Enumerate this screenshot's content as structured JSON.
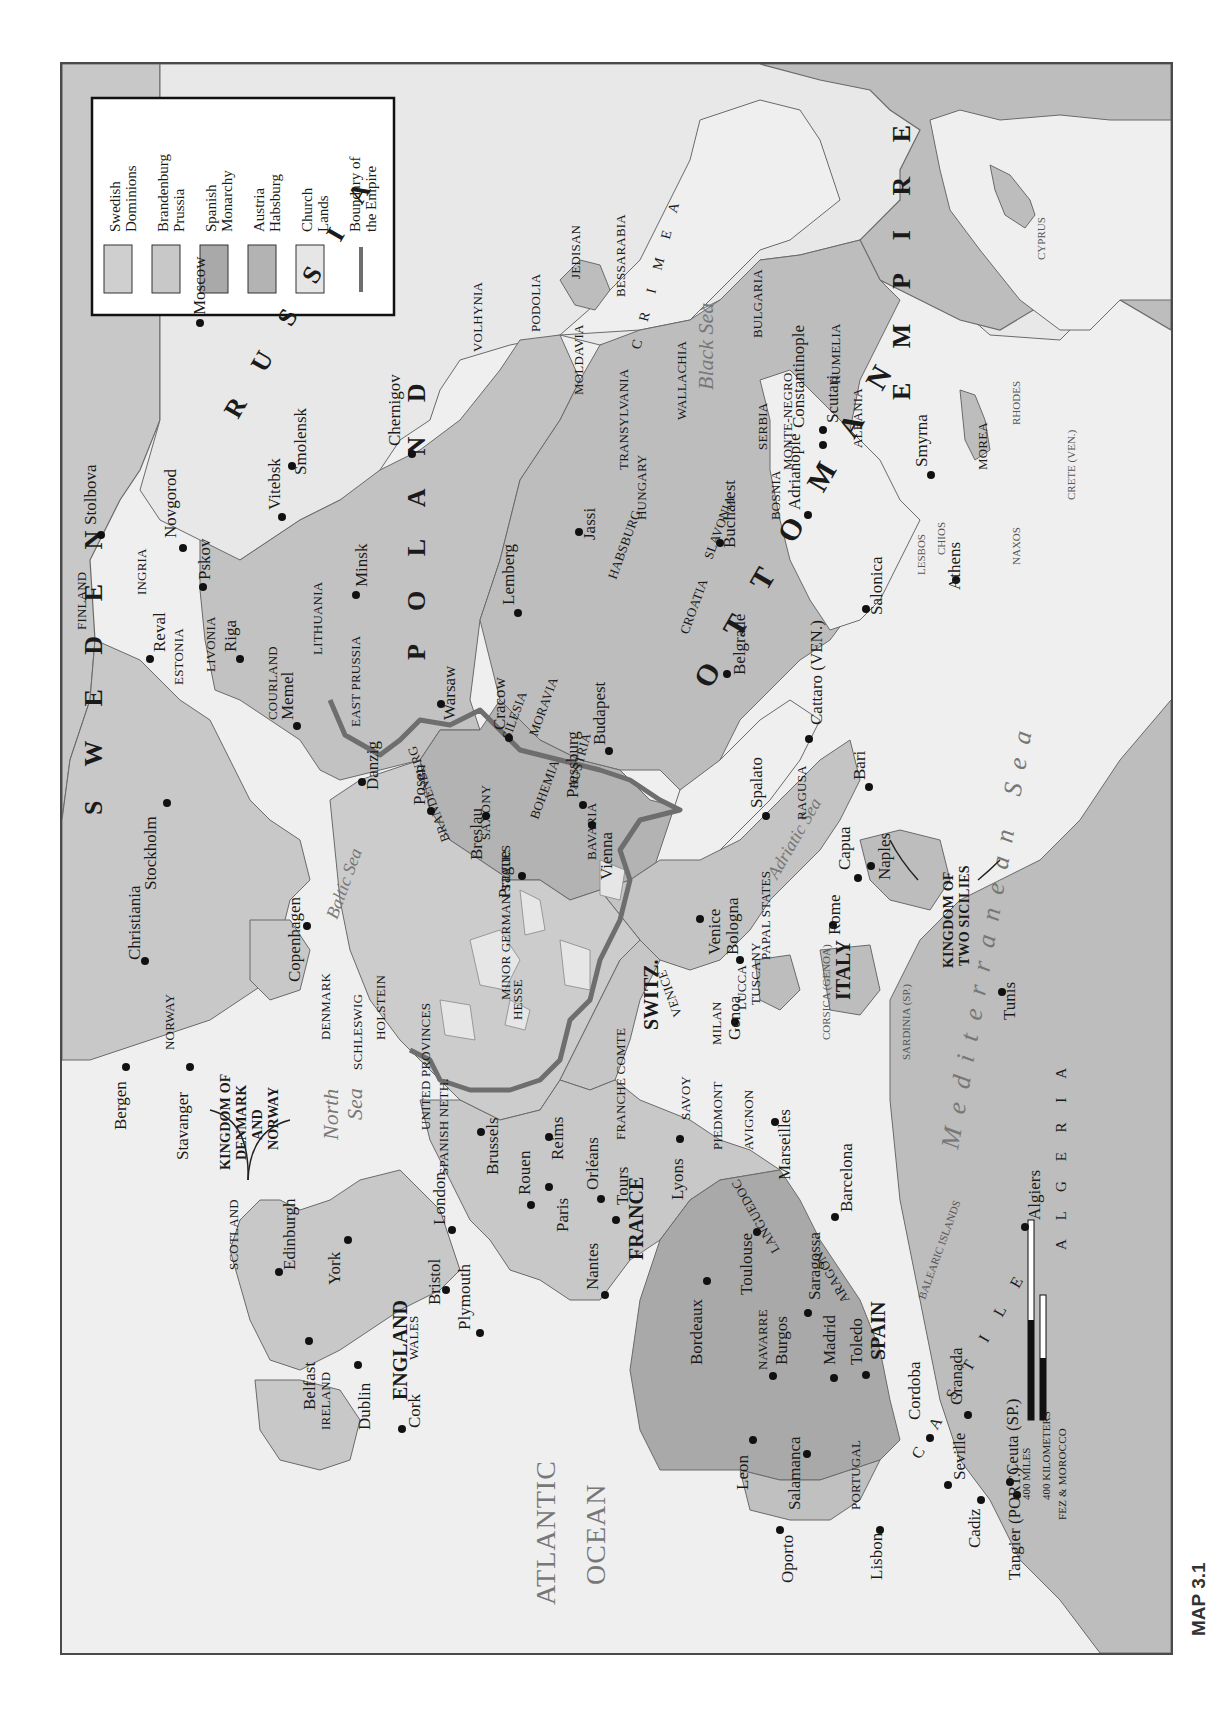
{
  "map": {
    "caption": "MAP 3.1",
    "orientation": "rotated 90° counter-clockwise (north at left)",
    "colors": {
      "sea": "#efefef",
      "land_other": "#bdbdbd",
      "land_light": "#e4e4e4",
      "swedish": "#cfcfcf",
      "brandenburg": "#c8c8c8",
      "spanish": "#a9a9a9",
      "austria": "#b3b3b3",
      "church": "#e6e6e6",
      "empire_boundary": "#6e6e6e",
      "coast_line": "#6a6a6a"
    },
    "legend": {
      "items": [
        {
          "line1": "Swedish",
          "line2": "Dominions",
          "key": "swedish"
        },
        {
          "line1": "Brandenburg",
          "line2": "Prussia",
          "key": "brandenburg"
        },
        {
          "line1": "Spanish",
          "line2": "Monarchy",
          "key": "spanish"
        },
        {
          "line1": "Austria",
          "line2": "Habsburg",
          "key": "austria"
        },
        {
          "line1": "Church",
          "line2": "Lands",
          "key": "church"
        },
        {
          "line1": "Boundary of",
          "line2": "the Empire",
          "key": "boundary"
        }
      ]
    },
    "scale": {
      "miles": "400 MILES",
      "kilometers": "400 KILOMETERS"
    },
    "states": {
      "sweden": "S W E D E N",
      "russia": "R U S S I A",
      "poland": "P O L A N D",
      "ottoman": "O T T O M A N",
      "empire": "E M P I R E",
      "france": "FRANCE",
      "spain": "SPAIN",
      "england": "ENGLAND",
      "italy": "ITALY",
      "switz": "SWITZ.",
      "algeria": "A L G E R I A",
      "castile": "C A S T I L E",
      "crimea": "C R I M E A",
      "kingdom_dk_no": [
        "KINGDOM OF",
        "DENMARK",
        "AND",
        "NORWAY"
      ],
      "kingdom_two_sicilies": [
        "KINGDOM OF",
        "TWO SICILIES"
      ]
    },
    "regions": [
      "FINLAND",
      "INGRIA",
      "ESTONIA",
      "LIVONIA",
      "COURLAND",
      "LITHUANIA",
      "EAST PRUSSIA",
      "VOLHYNIA",
      "PODOLIA",
      "JEDISAN",
      "BESSARABIA",
      "MOLDAVIA",
      "TRANSYLVANIA",
      "WALLACHIA",
      "BULGARIA",
      "RUMELIA",
      "SERBIA",
      "MONTE-NEGRO",
      "ALBANIA",
      "BOSNIA",
      "SLAVONIA",
      "HUNGARY",
      "CROATIA",
      "HABSBURG",
      "SILESIA",
      "MORAVIA",
      "BOHEMIA",
      "AUSTRIA",
      "BAVARIA",
      "SAXONY",
      "BRANDENBURG",
      "MINOR GERMAN STATES",
      "HESSE",
      "HOLSTEIN",
      "SCHLESWIG",
      "DENMARK",
      "NORWAY",
      "UNITED PROVINCES",
      "SPANISH NETH.",
      "FRANCHE COMTE",
      "SAVOY",
      "PIEDMONT",
      "AVIGNON",
      "LANGUEDOC",
      "MILAN",
      "VENICE",
      "LUCCA",
      "TUSCANY",
      "PAPAL STATES",
      "RAGUSA",
      "MOREA",
      "SCOTLAND",
      "WALES",
      "IRELAND",
      "NAVARRE",
      "ARAGON",
      "PORTUGAL",
      "FEZ & MOROCCO"
    ],
    "islands": [
      "CORSICA (GENOA)",
      "SARDINIA (SP.)",
      "BALEARIC ISLANDS",
      "LESBOS",
      "CHIOS",
      "NAXOS",
      "RHODES",
      "CRETE (VEN.)",
      "CYPRUS"
    ],
    "seas": [
      "Black Sea",
      "Baltic Sea",
      "North Sea",
      "Adriatic Sea",
      "Mediterranean Sea",
      "ATLANTIC OCEAN"
    ],
    "cities": [
      "Moscow",
      "Stolbova",
      "Novgorod",
      "Pskov",
      "Smolensk",
      "Vitebsk",
      "Chernigov",
      "Minsk",
      "Reval",
      "Riga",
      "Memel",
      "Danzig",
      "Posen",
      "Warsaw",
      "Cracow",
      "Lemberg",
      "Jassi",
      "Bucharest",
      "Constantinople",
      "Scutari",
      "Adrianople",
      "Smyrna",
      "Salonica",
      "Athens",
      "Belgrade",
      "Cattaro (VEN.)",
      "Spalato",
      "Bari",
      "Budapest",
      "Pressburg",
      "Vienna",
      "Breslau",
      "Prague",
      "Venice",
      "Bologna",
      "Genoa",
      "Rome",
      "Capua",
      "Naples",
      "Tunis",
      "Stockholm",
      "Christiania",
      "Copenhagen",
      "Bergen",
      "Stavanger",
      "Edinburgh",
      "York",
      "London",
      "Bristol",
      "Plymouth",
      "Belfast",
      "Dublin",
      "Cork",
      "Brussels",
      "Rouen",
      "Reims",
      "Paris",
      "Orléans",
      "Tours",
      "Nantes",
      "Lyons",
      "Marseilles",
      "Toulouse",
      "Bordeaux",
      "Barcelona",
      "Saragossa",
      "Burgos",
      "Madrid",
      "Toledo",
      "Leon",
      "Salamanca",
      "Cordoba",
      "Granada",
      "Seville",
      "Cadiz",
      "Lisbon",
      "Oporto",
      "Ceuta (SP.)",
      "Tangier (PORT.)",
      "Algiers"
    ]
  }
}
